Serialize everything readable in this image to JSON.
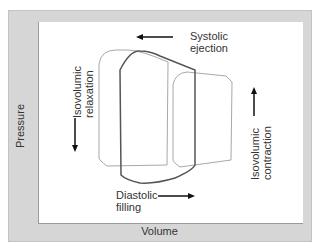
{
  "diagram": {
    "axes": {
      "x_label": "Volume",
      "y_label": "Pressure"
    },
    "annotations": {
      "systolic_ejection": {
        "line1": "Systolic",
        "line2": "ejection",
        "arrow": "left"
      },
      "diastolic_filling": {
        "line1": "Diastolic",
        "line2": "filling",
        "arrow": "right"
      },
      "isovolumic_relaxation": {
        "line1": "Isovolumic",
        "line2": "relaxation",
        "arrow": "down"
      },
      "isovolumic_contraction": {
        "line1": "Isovolumic",
        "line2": "contraction",
        "arrow": "up"
      }
    },
    "loops": [
      {
        "name": "left-loop",
        "stroke": "#a8a8a8"
      },
      {
        "name": "center-loop",
        "stroke": "#555555"
      },
      {
        "name": "right-loop",
        "stroke": "#a8a8a8"
      }
    ],
    "colors": {
      "panel": "#d6d6d6",
      "plot": "#ffffff",
      "text": "#333333",
      "arrow": "#111111"
    }
  }
}
